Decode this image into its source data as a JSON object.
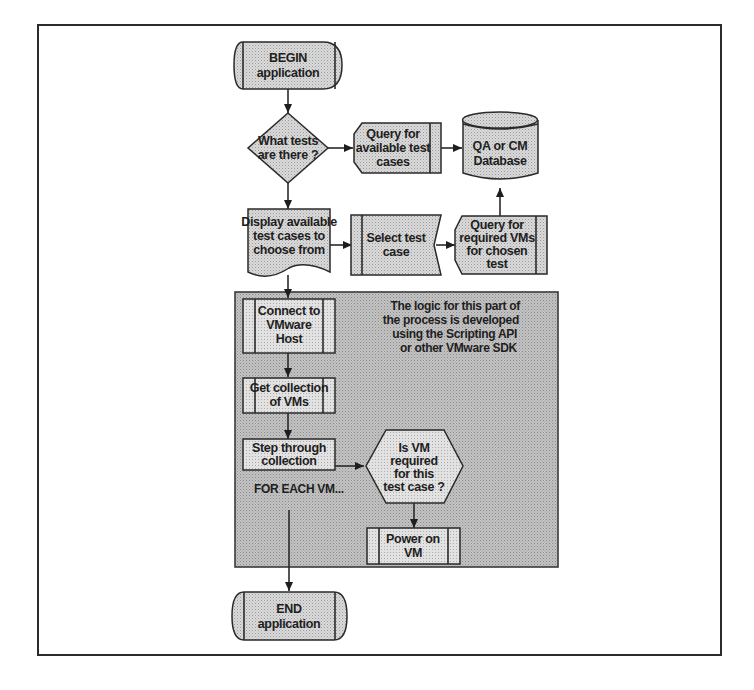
{
  "diagram": {
    "type": "flowchart",
    "start": {
      "line1": "BEGIN",
      "line2": "application"
    },
    "decision_tests": {
      "line1": "What tests",
      "line2": "are there ?"
    },
    "query_available": {
      "line1": "Query for",
      "line2": "available test",
      "line3": "cases"
    },
    "database": {
      "line1": "QA or CM",
      "line2": "Database"
    },
    "display_cases": {
      "line1": "Display available",
      "line2": "test cases to",
      "line3": "choose from"
    },
    "select_case": {
      "line1": "Select test",
      "line2": "case"
    },
    "query_required": {
      "line1": "Query for",
      "line2": "required VMs",
      "line3": "for chosen",
      "line4": "test"
    },
    "vmware_region": {
      "note_line1": "The logic for this part of",
      "note_line2": "the process is developed",
      "note_line3": "using the  Scripting API",
      "note_line4": "or other VMware SDK"
    },
    "connect_host": {
      "line1": "Connect to",
      "line2": "VMware",
      "line3": "Host"
    },
    "get_collection": {
      "line1": "Get collection",
      "line2": "of VMs"
    },
    "step_through": {
      "line1": "Step through",
      "line2": "collection"
    },
    "loop_label": "FOR EACH VM...",
    "decision_vm": {
      "line1": "Is VM",
      "line2": "required",
      "line3": "for this",
      "line4": "test case  ?"
    },
    "power_on": {
      "line1": "Power on",
      "line2": "VM"
    },
    "end": {
      "line1": "END",
      "line2": "application"
    }
  },
  "colors": {
    "shape_fill": "#d4d4d4",
    "region_fill": "#b9b9b9",
    "stroke": "#2a2a2a",
    "background": "#ffffff"
  }
}
